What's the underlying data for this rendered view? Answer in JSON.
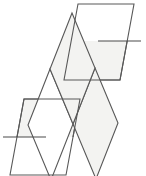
{
  "figure": {
    "canvas": {
      "width": 146,
      "height": 176
    },
    "background_color": "#ffffff",
    "stroke_color": "#585858",
    "crease_color": "#4a4a4a",
    "fill_shaded": "#f3f3f1",
    "fill_plain": "#ffffff",
    "stroke_width": 1.1,
    "face_count": 5,
    "crease_count": 2
  },
  "chart_data": {
    "type": "diagram",
    "faces": [
      {
        "id": "face-top-right",
        "label": "Top-right rhombus",
        "fill": "shaded-lower-half",
        "points": "78,4 134,4 120,80 64,80",
        "split": true
      },
      {
        "id": "face-upper-middle",
        "label": "Upper middle rhombus",
        "fill": "shaded",
        "points": "72,13 95,68 73,124 50,69"
      },
      {
        "id": "face-center",
        "label": "Center rhombus",
        "fill": "plain",
        "points": "50,69 73,124 51,180 28,125"
      },
      {
        "id": "face-lower-middle",
        "label": "Lower middle rhombus",
        "fill": "shaded",
        "points": "95,68 118,123 96,179 73,124"
      },
      {
        "id": "face-bottom-left",
        "label": "Bottom-left rhombus",
        "fill": "shaded-upper-half",
        "points": "24,99 80,99 66,175 10,175",
        "split": true
      }
    ],
    "creases": [
      {
        "id": "crease-top-right",
        "label": "Top-right horizontal crease",
        "x1": 98,
        "y1": 41,
        "x2": 141,
        "y2": 41
      },
      {
        "id": "crease-bottom-left",
        "label": "Bottom-left horizontal crease",
        "x1": 3,
        "y1": 137,
        "x2": 46,
        "y2": 137
      }
    ]
  }
}
